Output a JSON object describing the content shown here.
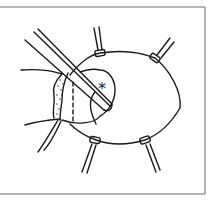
{
  "figure": {
    "kind": "surgical line illustration",
    "annotations": [
      {
        "id": "asterisk-marker",
        "text": "*"
      }
    ],
    "colors": {
      "ink": "#1a1a1a",
      "frame": "#6b6b6b",
      "background": "#ffffff"
    }
  }
}
